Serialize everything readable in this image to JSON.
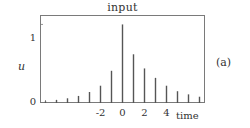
{
  "panel": {
    "label": "(a)"
  },
  "chart_data": {
    "type": "bar",
    "title": "input",
    "xlabel": "time",
    "ylabel": "u",
    "xlim": [
      -7.5,
      7.5
    ],
    "ylim": [
      0,
      1.12
    ],
    "grid": false,
    "legend": null,
    "style": "stem",
    "stem_color": "#555555",
    "axis_color": "#7a7a7a",
    "x_tick_values": [
      -7,
      -6,
      -5,
      -4,
      -3,
      -2,
      -1,
      0,
      1,
      2,
      3,
      4,
      5,
      6,
      7
    ],
    "x_tick_labels": [
      "",
      "",
      "",
      "",
      "",
      "-2",
      "",
      "0",
      "",
      "2",
      "",
      "4",
      "",
      "",
      ""
    ],
    "x_labeled_ticks": [
      {
        "value": -2,
        "label": "-2"
      },
      {
        "value": 0,
        "label": "0"
      },
      {
        "value": 2,
        "label": "2"
      },
      {
        "value": 4,
        "label": "4"
      }
    ],
    "y_tick_values": [
      0,
      1
    ],
    "y_tick_labels": [
      "0",
      "1"
    ],
    "categories": [
      -7,
      -6,
      -5,
      -4,
      -3,
      -2,
      -1,
      0,
      1,
      2,
      3,
      4,
      5,
      6,
      7
    ],
    "values": [
      0.02,
      0.04,
      0.06,
      0.09,
      0.14,
      0.22,
      0.41,
      1.0,
      0.62,
      0.44,
      0.32,
      0.22,
      0.15,
      0.11,
      0.08
    ]
  }
}
